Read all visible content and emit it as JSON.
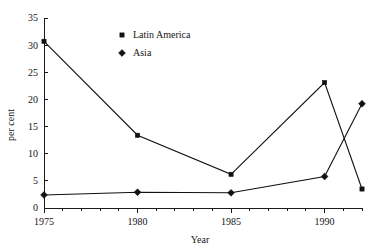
{
  "chart_data": {
    "type": "line",
    "title": "",
    "subtitle": "",
    "xlabel": "Year",
    "ylabel": "per cent",
    "x": [
      1975,
      1980,
      1985,
      1990,
      1992
    ],
    "xlim": [
      1975,
      1992
    ],
    "ylim": [
      0,
      35
    ],
    "grid": false,
    "legend_position": "top-center",
    "x_tick_labels": [
      "1975",
      "1980",
      "1985",
      "1990"
    ],
    "x_tick_values": [
      1975,
      1980,
      1985,
      1990
    ],
    "x_minor_tick_values": [
      1976,
      1977,
      1978,
      1979,
      1981,
      1982,
      1983,
      1984,
      1986,
      1987,
      1988,
      1989,
      1991,
      1992
    ],
    "y_tick_labels": [
      "0",
      "5",
      "10",
      "15",
      "20",
      "25",
      "30",
      "35"
    ],
    "y_tick_values": [
      0,
      5,
      10,
      15,
      20,
      25,
      30,
      35
    ],
    "series": [
      {
        "name": "Latin America",
        "marker": "square",
        "color": "#111111",
        "x": [
          1975,
          1980,
          1985,
          1990,
          1992
        ],
        "values": [
          30.7,
          13.4,
          6.2,
          23.1,
          3.5
        ]
      },
      {
        "name": "Asia",
        "marker": "diamond",
        "color": "#111111",
        "x": [
          1975,
          1980,
          1985,
          1990,
          1992
        ],
        "values": [
          2.4,
          2.9,
          2.8,
          5.8,
          19.2
        ]
      }
    ],
    "annotations": []
  },
  "legend": {
    "entries": [
      {
        "label": "Latin America",
        "marker": "square"
      },
      {
        "label": "Asia",
        "marker": "diamond"
      }
    ]
  },
  "axes": {
    "x_title": "Year",
    "y_title": "per cent"
  }
}
